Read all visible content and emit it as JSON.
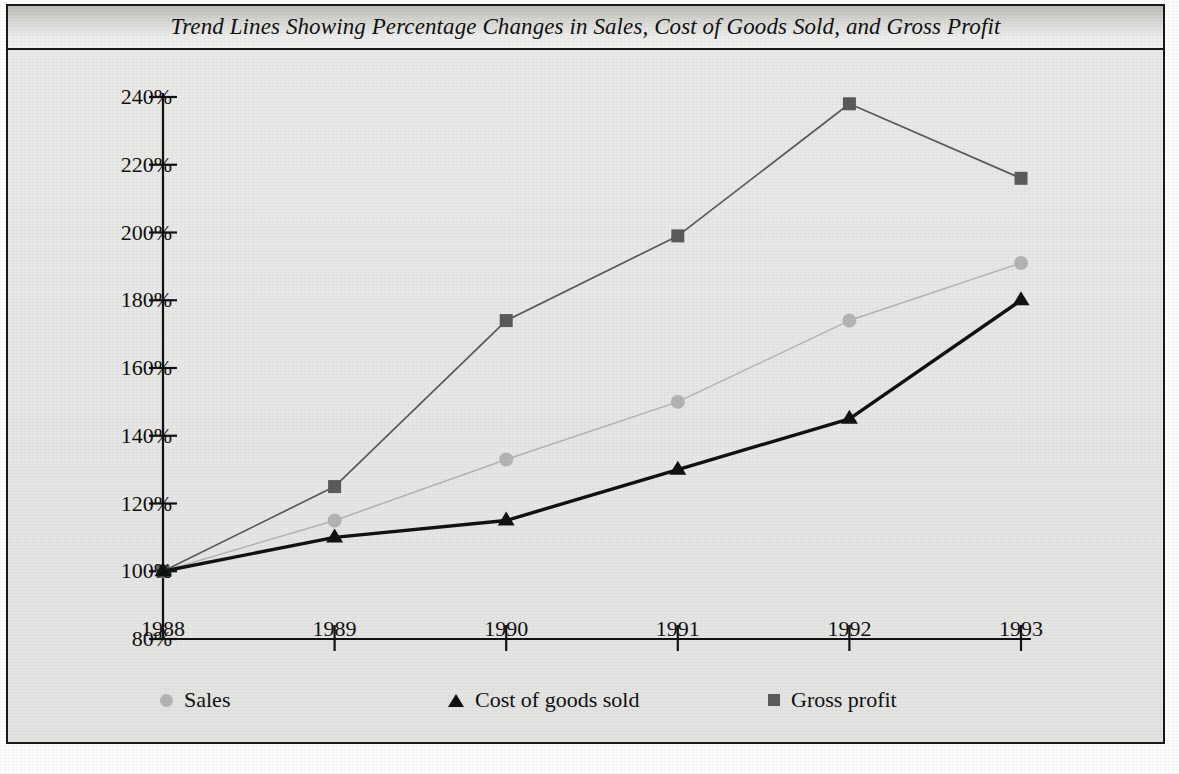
{
  "figure": {
    "title": "Trend Lines Showing Percentage Changes in Sales, Cost of Goods Sold, and Gross Profit"
  },
  "legend": {
    "items": [
      {
        "label": "Sales",
        "marker": "circle-marker-icon",
        "color": "#b4b4b4"
      },
      {
        "label": "Cost of goods sold",
        "marker": "triangle-marker-icon",
        "color": "#111111"
      },
      {
        "label": "Gross profit",
        "marker": "square-marker-icon",
        "color": "#5a5a5a"
      }
    ]
  },
  "chart_data": {
    "type": "line",
    "title": "Trend Lines Showing Percentage Changes in Sales, Cost of Goods Sold, and Gross Profit",
    "xlabel": "",
    "ylabel": "",
    "x": [
      1988,
      1989,
      1990,
      1991,
      1992,
      1993
    ],
    "categories": [
      "1988",
      "1989",
      "1990",
      "1991",
      "1992",
      "1993"
    ],
    "xtick_labels": [
      "1988",
      "1989",
      "1990",
      "1991",
      "1992",
      "1993"
    ],
    "ytick_labels": [
      "240%",
      "220%",
      "200%",
      "180%",
      "160%",
      "140%",
      "120%",
      "100%",
      "80%"
    ],
    "ytick_values": [
      240,
      220,
      200,
      180,
      160,
      140,
      120,
      100,
      80
    ],
    "ylim": [
      80,
      240
    ],
    "xlim": [
      1988,
      1993
    ],
    "grid": false,
    "legend_position": "bottom",
    "series": [
      {
        "name": "Sales",
        "color": "#b4b4b4",
        "marker": "circle",
        "values": [
          100,
          115,
          133,
          150,
          174,
          191
        ]
      },
      {
        "name": "Cost of goods sold",
        "color": "#111111",
        "marker": "triangle",
        "values": [
          100,
          110,
          115,
          130,
          145,
          180
        ]
      },
      {
        "name": "Gross profit",
        "color": "#5a5a5a",
        "marker": "square",
        "values": [
          100,
          125,
          174,
          199,
          238,
          216
        ]
      }
    ]
  }
}
